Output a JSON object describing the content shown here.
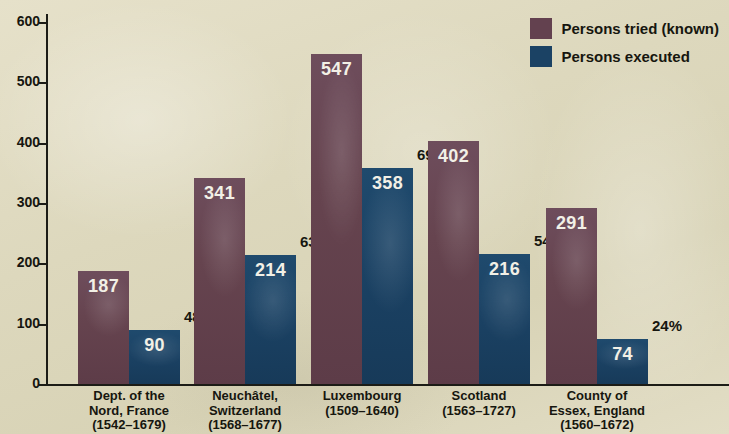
{
  "chart_data": {
    "type": "bar",
    "title": "",
    "xlabel": "",
    "ylabel": "",
    "ylim": [
      0,
      600
    ],
    "yticks": [
      0,
      100,
      200,
      300,
      400,
      500,
      600
    ],
    "grid": false,
    "legend_position": "top-right",
    "categories": [
      "Dept. of the Nord, France (1542–1679)",
      "Neuchâtel, Switzerland (1568–1677)",
      "Luxembourg (1509–1640)",
      "Scotland (1563–1727)",
      "County of Essex, England (1560–1672)"
    ],
    "category_lines": [
      [
        "Dept. of the",
        "Nord, France",
        "(1542–1679)"
      ],
      [
        "Neuchâtel,",
        "Switzerland",
        "(1568–1677)"
      ],
      [
        "Luxembourg",
        "(1509–1640)"
      ],
      [
        "Scotland",
        "(1563–1727)"
      ],
      [
        "County of",
        "Essex, England",
        "(1560–1672)"
      ]
    ],
    "series": [
      {
        "name": "Persons tried (known)",
        "color": "#63414f",
        "values": [
          187,
          341,
          547,
          402,
          291
        ]
      },
      {
        "name": "Persons executed",
        "color": "#1b4264",
        "values": [
          90,
          214,
          358,
          216,
          74
        ]
      }
    ],
    "annotations": {
      "label": "execution rate",
      "values": [
        "48%",
        "63%",
        "69%",
        "54%",
        "24%"
      ]
    },
    "colors": {
      "background": "#ded9c0",
      "tried": "#63414f",
      "executed": "#1b4264",
      "text": "#16160f",
      "bar_value_text": "#f2f0e6"
    }
  }
}
